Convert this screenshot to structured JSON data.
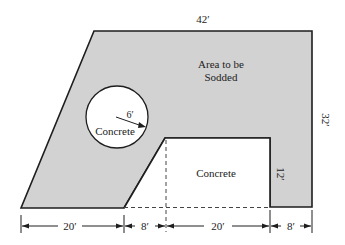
{
  "diagram": {
    "colors": {
      "sod_fill": "#d2d2d2",
      "outline": "#1e1e1e",
      "concrete_fill": "#ffffff",
      "background": "#ffffff"
    },
    "labels": {
      "sod_area_line1": "Area to be",
      "sod_area_line2": "Sodded",
      "circle_concrete": "Concrete",
      "rect_concrete": "Concrete",
      "radius": "6′"
    },
    "dimensions": {
      "top_width": "42′",
      "right_height": "32′",
      "notch_height": "12′",
      "bottom_segments": [
        "20′",
        "8′",
        "20′",
        "8′"
      ]
    }
  }
}
